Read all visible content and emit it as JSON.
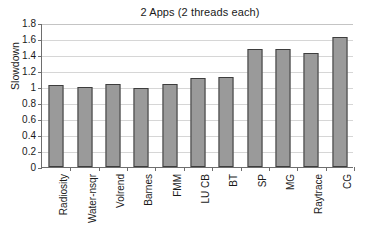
{
  "chart_data": {
    "type": "bar",
    "title": "2 Apps (2 threads each)",
    "xlabel": "",
    "ylabel": "Slowdown",
    "ylim": [
      0,
      1.8
    ],
    "ytick_step": 0.2,
    "yticks": [
      "1.8",
      "1.6",
      "1.4",
      "1.2",
      "1",
      "0.8",
      "0.6",
      "0.4",
      "0.2",
      "0"
    ],
    "ytick_values": [
      1.8,
      1.6,
      1.4,
      1.2,
      1.0,
      0.8,
      0.6,
      0.4,
      0.2,
      0
    ],
    "grid": true,
    "legend": false,
    "categories": [
      "Radiosity",
      "Water-nsqr",
      "Volrend",
      "Barnes",
      "FMM",
      "LU CB",
      "BT",
      "SP",
      "MG",
      "Raytrace",
      "CG"
    ],
    "values": [
      1.02,
      1.0,
      1.04,
      0.99,
      1.04,
      1.11,
      1.13,
      1.47,
      1.47,
      1.42,
      1.62
    ],
    "series": [
      {
        "name": "Slowdown",
        "values": [
          1.02,
          1.0,
          1.04,
          0.99,
          1.04,
          1.11,
          1.13,
          1.47,
          1.47,
          1.42,
          1.62
        ]
      }
    ],
    "colors": {
      "bar_fill": "#9a9a9a",
      "bar_border": "#3d3d3d",
      "gridline": "#d6d6d6",
      "axis": "#6e6e6e",
      "background": "#ffffff",
      "text": "#1a1a1a"
    }
  }
}
